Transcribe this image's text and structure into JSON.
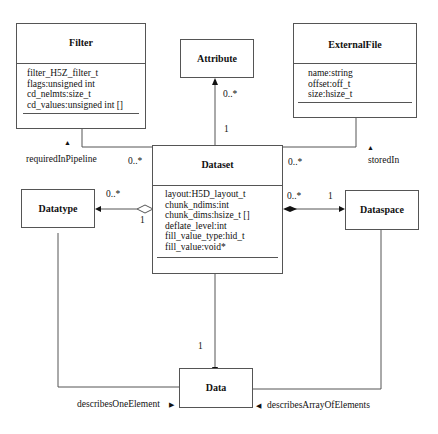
{
  "diagram": {
    "type": "UML class diagram",
    "classes": {
      "filter": {
        "name": "Filter",
        "attributes": [
          "filter_H5Z_filter_t",
          "flags:unsigned int",
          "cd_nelmts:size_t",
          "cd_values:unsigned int []"
        ]
      },
      "attribute": {
        "name": "Attribute"
      },
      "external_file": {
        "name": "ExternalFile",
        "attributes": [
          "name:string",
          "offset:off_t",
          "size:hsize_t"
        ]
      },
      "dataset": {
        "name": "Dataset",
        "attributes": [
          "layout:H5D_layout_t",
          "chunk_ndims:int",
          "chunk_dims:hsize_t []",
          "deflate_level:int",
          "fill_value_type:hid_t",
          "fill_value:void*"
        ]
      },
      "datatype": {
        "name": "Datatype"
      },
      "dataspace": {
        "name": "Dataspace"
      },
      "data": {
        "name": "Data"
      }
    },
    "associations": {
      "filter_dataset": {
        "role": "requiredInPipeline",
        "role_arrow": "▲",
        "multiplicity_dataset": "0..*"
      },
      "attribute_dataset": {
        "multiplicity_attribute": "0..*",
        "multiplicity_dataset": "1"
      },
      "externalfile_dataset": {
        "role": "storedIn",
        "role_arrow": "▲",
        "multiplicity_dataset": "0..*"
      },
      "dataset_datatype": {
        "multiplicity_datatype": "0..*",
        "multiplicity_dataset": "1",
        "kind": "aggregation"
      },
      "dataset_dataspace": {
        "multiplicity_dataset": "0..*",
        "multiplicity_dataspace": "1",
        "kind": "composition"
      },
      "dataset_data": {
        "multiplicity_data": "1"
      },
      "datatype_data": {
        "role": "describesOneElement",
        "role_arrow": "▶"
      },
      "dataspace_data": {
        "role": "describesArrayOfElements",
        "role_arrow": "◀"
      }
    }
  }
}
